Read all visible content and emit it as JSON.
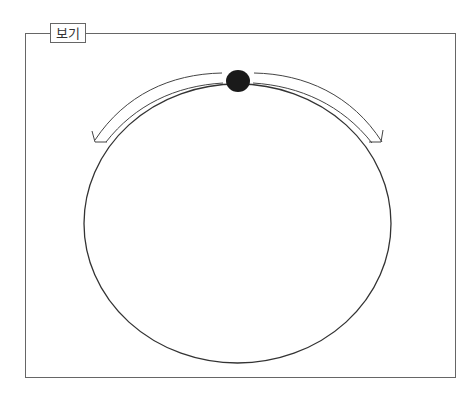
{
  "header": {
    "cut_text": ""
  },
  "figure": {
    "label": "보기",
    "elements": {
      "circle": {
        "cx": 237.5,
        "cy": 223.5,
        "rx": 153.5,
        "ry": 139.5,
        "stroke": "#333333"
      },
      "dot": {
        "cx": 238,
        "cy": 81,
        "rx": 12,
        "ry": 11,
        "fill": "#1a1a1a"
      },
      "arrows": [
        {
          "direction": "counterclockwise",
          "side": "left"
        },
        {
          "direction": "clockwise",
          "side": "right"
        }
      ]
    }
  }
}
